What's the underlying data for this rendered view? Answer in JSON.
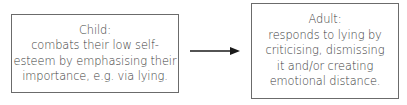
{
  "diagram": {
    "nodes": [
      {
        "id": "child",
        "lines": [
          "Child:",
          "combats their low self-",
          "esteem by emphasising their",
          "importance, e.g. via lying."
        ]
      },
      {
        "id": "adult",
        "lines": [
          "Adult:",
          "responds to lying by",
          "criticising, dismissing",
          "it and/or creating",
          "emotional distance."
        ]
      }
    ],
    "edges": [
      {
        "from": "child",
        "to": "adult",
        "type": "arrow"
      }
    ],
    "colors": {
      "border": "#6b6b6b",
      "text": "#3a3a3a",
      "arrow": "#1a1a1a"
    }
  }
}
